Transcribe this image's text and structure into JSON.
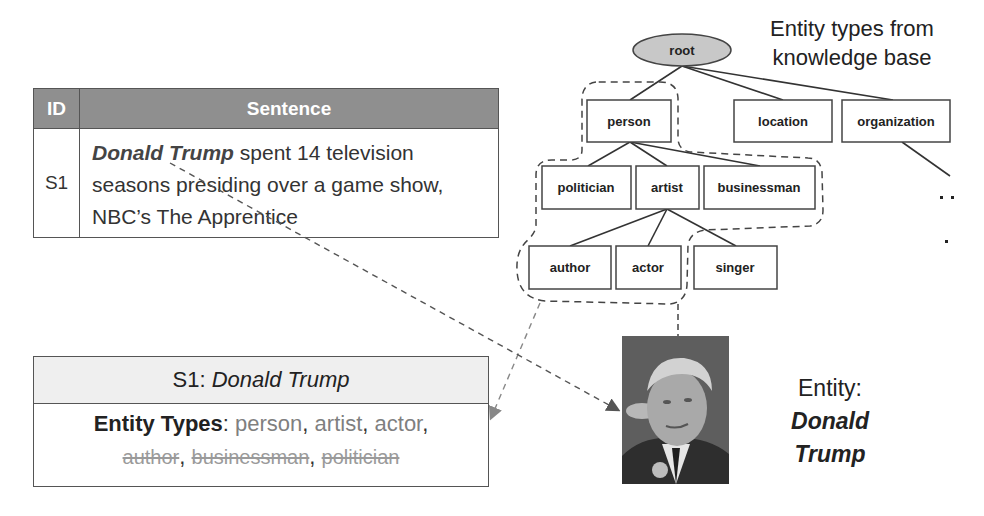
{
  "sentence_table": {
    "headers": {
      "id": "ID",
      "sentence": "Sentence"
    },
    "rows": [
      {
        "id": "S1",
        "mention": "Donald Trump",
        "text_after_mention": " spent 14 television seasons presiding over a game show, NBC’s The Apprentice"
      }
    ]
  },
  "knowledge_base": {
    "title_line1": "Entity types from",
    "title_line2": "knowledge base",
    "root": "root",
    "level1": [
      "person",
      "location",
      "organization"
    ],
    "level2": [
      "politician",
      "artist",
      "businessman"
    ],
    "level3": [
      "author",
      "actor",
      "singer"
    ],
    "ellipsis": ". . ."
  },
  "summary": {
    "sentence_id": "S1:",
    "mention": "Donald Trump",
    "label": "Entity Types",
    "label_sep": ":",
    "kept_types": [
      "person",
      "artist",
      "actor"
    ],
    "removed_types": [
      "author",
      "businessman",
      "politician"
    ]
  },
  "entity": {
    "label": "Entity:",
    "name_line1": "Donald",
    "name_line2": "Trump",
    "photo_alt": "photo of Donald Trump"
  },
  "colors": {
    "table_header_bg": "#8f8f8f",
    "summary_header_bg": "#efefef",
    "root_fill": "#c8c8c8",
    "kept_type": "#7f7f7f",
    "removed_type": "#9a9a9a"
  }
}
